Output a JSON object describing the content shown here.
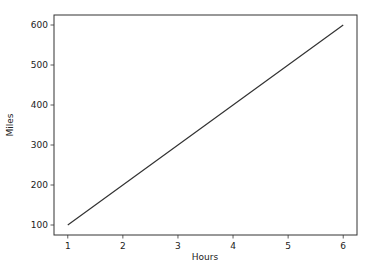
{
  "chart_data": {
    "type": "line",
    "title": "",
    "xlabel": "Hours",
    "ylabel": "Miles",
    "x": [
      1,
      2,
      3,
      4,
      5,
      6
    ],
    "series": [
      {
        "name": "Miles",
        "values": [
          100,
          200,
          300,
          400,
          500,
          600
        ],
        "color": "#333333"
      }
    ],
    "xticks": [
      "1",
      "2",
      "3",
      "4",
      "5",
      "6"
    ],
    "yticks": [
      "100",
      "200",
      "300",
      "400",
      "500",
      "600"
    ],
    "xlim": [
      0.75,
      6.25
    ],
    "ylim": [
      75,
      625
    ],
    "grid": false,
    "legend": null
  }
}
